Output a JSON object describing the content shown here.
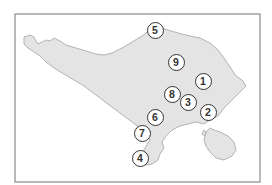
{
  "map": {
    "frame": {
      "x": 15,
      "y": 14,
      "w": 245,
      "h": 168,
      "stroke": "#8a8a8a"
    },
    "colors": {
      "land": "#e4e4e4",
      "coast": "#b3b3b3",
      "water": "#ffffff",
      "marker_stroke": "#333333",
      "marker_fill": "#ffffff"
    },
    "markers": [
      {
        "label": "1",
        "x": 203,
        "y": 81
      },
      {
        "label": "2",
        "x": 208,
        "y": 112
      },
      {
        "label": "3",
        "x": 188,
        "y": 102
      },
      {
        "label": "4",
        "x": 140,
        "y": 158
      },
      {
        "label": "5",
        "x": 155,
        "y": 30
      },
      {
        "label": "6",
        "x": 155,
        "y": 117
      },
      {
        "label": "7",
        "x": 142,
        "y": 133
      },
      {
        "label": "8",
        "x": 172,
        "y": 94
      },
      {
        "label": "9",
        "x": 176,
        "y": 62
      }
    ]
  }
}
